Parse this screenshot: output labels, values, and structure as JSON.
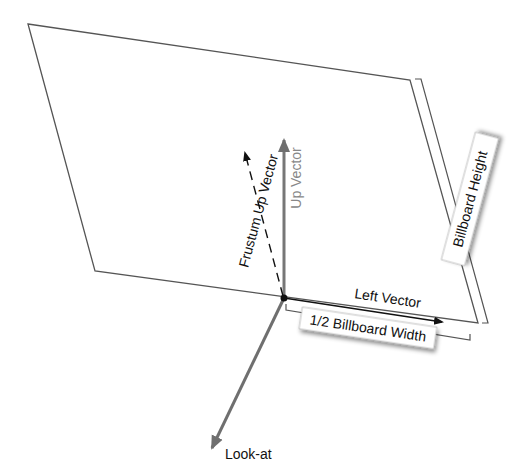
{
  "diagram": {
    "type": "billboard-geometry",
    "colors": {
      "outline": "#555555",
      "up_vector": "#777777",
      "look_at": "#666666",
      "left_vector": "#111111",
      "frustum_up": "#111111",
      "label_box_bg": "#ffffff",
      "label_text": "#111111",
      "up_label_text": "#888888"
    },
    "labels": {
      "frustum_up_vector": "Frustum Up Vector",
      "up_vector": "Up Vector",
      "left_vector": "Left Vector",
      "look_at": "Look-at",
      "billboard_height": "Billboard Height",
      "half_billboard_width": "1/2 Billboard Width"
    }
  }
}
